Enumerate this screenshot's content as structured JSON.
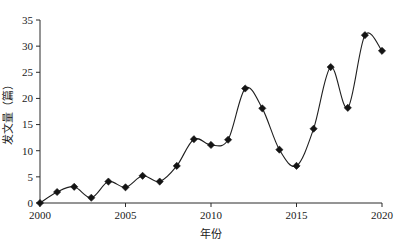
{
  "chart_data": {
    "type": "line",
    "title": "",
    "xlabel": "年份",
    "ylabel": "发文量（篇）",
    "x": [
      2000,
      2001,
      2002,
      2003,
      2004,
      2005,
      2006,
      2007,
      2008,
      2009,
      2010,
      2011,
      2012,
      2013,
      2014,
      2015,
      2016,
      2017,
      2018,
      2019,
      2020
    ],
    "values": [
      0,
      2.1,
      3.1,
      1.0,
      4.1,
      3.0,
      5.2,
      4.1,
      7.1,
      12.2,
      11.1,
      12.1,
      21.9,
      18.1,
      10.2,
      7.1,
      14.2,
      26.0,
      18.2,
      32.1,
      29.1
    ],
    "series": [
      {
        "name": "发文量",
        "values": [
          0,
          2.1,
          3.1,
          1.0,
          4.1,
          3.0,
          5.2,
          4.1,
          7.1,
          12.2,
          11.1,
          12.1,
          21.9,
          18.1,
          10.2,
          7.1,
          14.2,
          26.0,
          18.2,
          32.1,
          29.1
        ]
      }
    ],
    "xlim": [
      2000,
      2020
    ],
    "ylim": [
      0,
      35
    ],
    "xticks": [
      2000,
      2005,
      2010,
      2015,
      2020
    ],
    "xtick_labels": [
      "2000",
      "2005",
      "2010",
      "2015",
      "2020"
    ],
    "yticks": [
      0,
      5,
      10,
      15,
      20,
      25,
      30,
      35
    ],
    "ytick_labels": [
      "0",
      "5",
      "10",
      "15",
      "20",
      "25",
      "30",
      "35"
    ],
    "grid": false,
    "legend": null,
    "marker": "diamond",
    "line_color": "#1f1f1f",
    "marker_color": "#141414",
    "axis_color": "#2b2b2b",
    "background": "#ffffff"
  }
}
